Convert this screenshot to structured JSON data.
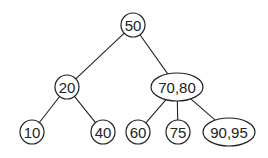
{
  "diagram": {
    "type": "2-3 tree",
    "nodes": [
      {
        "id": "n50",
        "label": "50",
        "x": 133,
        "y": 25,
        "rx": 12,
        "ry": 12
      },
      {
        "id": "n20",
        "label": "20",
        "x": 67,
        "y": 87,
        "rx": 12,
        "ry": 12
      },
      {
        "id": "n7080",
        "label": "70,80",
        "x": 177,
        "y": 87,
        "rx": 26,
        "ry": 14
      },
      {
        "id": "n10",
        "label": "10",
        "x": 32,
        "y": 132,
        "rx": 12,
        "ry": 12
      },
      {
        "id": "n40",
        "label": "40",
        "x": 103,
        "y": 132,
        "rx": 12,
        "ry": 12
      },
      {
        "id": "n60",
        "label": "60",
        "x": 138,
        "y": 132,
        "rx": 12,
        "ry": 12
      },
      {
        "id": "n75",
        "label": "75",
        "x": 178,
        "y": 132,
        "rx": 12,
        "ry": 12
      },
      {
        "id": "n9095",
        "label": "90,95",
        "x": 229,
        "y": 132,
        "rx": 26,
        "ry": 14
      }
    ],
    "edges": [
      {
        "from": "n50",
        "to": "n20"
      },
      {
        "from": "n50",
        "to": "n7080"
      },
      {
        "from": "n20",
        "to": "n10"
      },
      {
        "from": "n20",
        "to": "n40"
      },
      {
        "from": "n7080",
        "to": "n60"
      },
      {
        "from": "n7080",
        "to": "n75"
      },
      {
        "from": "n7080",
        "to": "n9095"
      }
    ]
  }
}
